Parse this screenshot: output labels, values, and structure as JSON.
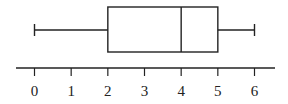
{
  "chart_data": {
    "type": "boxplot",
    "title": "",
    "xlabel": "",
    "ylabel": "",
    "min": 0,
    "q1": 2,
    "median": 4,
    "q3": 5,
    "max": 6,
    "axis": {
      "range": [
        0,
        6
      ],
      "ticks": [
        0,
        1,
        2,
        3,
        4,
        5,
        6
      ],
      "tick_labels": [
        "0",
        "1",
        "2",
        "3",
        "4",
        "5",
        "6"
      ]
    },
    "grid": false,
    "legend": null
  },
  "colors": {
    "stroke": "#222222",
    "background": "#ffffff"
  }
}
